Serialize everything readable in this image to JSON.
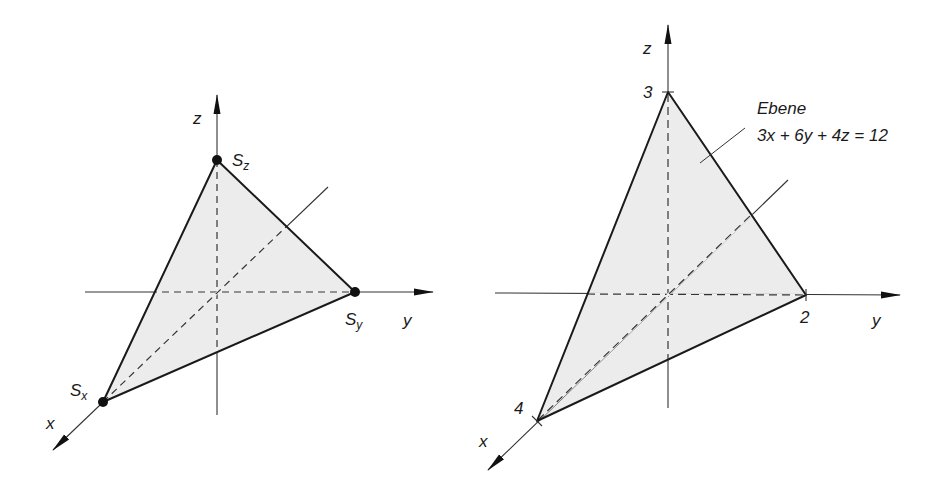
{
  "left_figure": {
    "axes": {
      "x_label": "x",
      "y_label": "y",
      "z_label": "z"
    },
    "points": {
      "sx": {
        "label": "S",
        "sub": "x"
      },
      "sy": {
        "label": "S",
        "sub": "y"
      },
      "sz": {
        "label": "S",
        "sub": "z"
      }
    }
  },
  "right_figure": {
    "axes": {
      "x_label": "x",
      "y_label": "y",
      "z_label": "z"
    },
    "intercepts": {
      "x": "4",
      "y": "2",
      "z": "3"
    },
    "plane_label": {
      "title": "Ebene",
      "equation": "3x + 6y + 4z = 12"
    }
  },
  "colors": {
    "fill": "#ececec",
    "line": "#1a1a1a",
    "axis": "#333333"
  }
}
